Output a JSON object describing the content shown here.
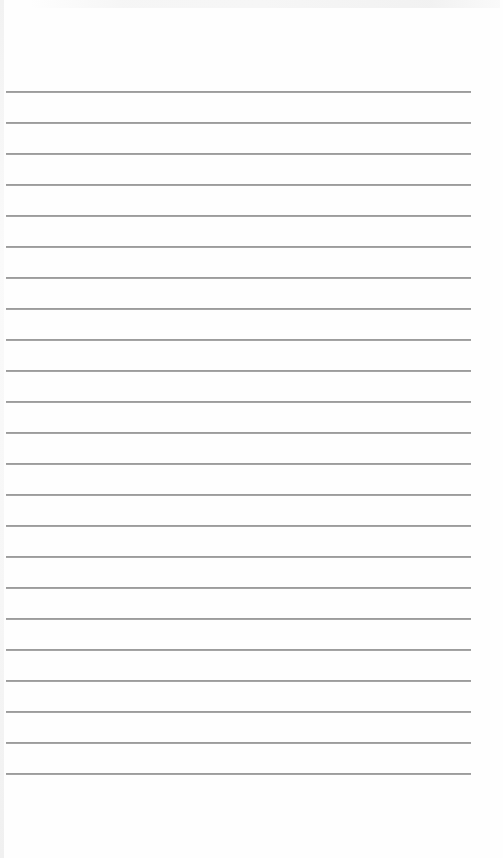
{
  "page": {
    "type": "ruled-notebook-page",
    "background_color": "#fefefe",
    "line_color": "#9c9c9c",
    "line_left": 6,
    "line_width": 465,
    "line_positions": [
      91,
      122,
      153,
      184,
      215,
      246,
      277,
      308,
      339,
      370,
      401,
      432,
      463,
      494,
      525,
      556,
      587,
      618,
      649,
      680,
      711,
      742,
      773
    ],
    "line_count": 23
  }
}
